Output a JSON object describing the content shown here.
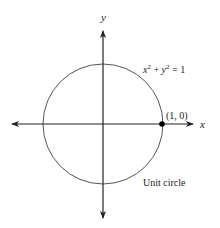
{
  "diagram": {
    "title": "Unit circle",
    "equation": {
      "x": "x",
      "exp1": "2",
      "plus": " + ",
      "y": "y",
      "exp2": "2",
      "eq": " = 1"
    },
    "axes": {
      "x_label": "x",
      "y_label": "y"
    },
    "point": {
      "label": "(1, 0)"
    },
    "caption": "Unit circle",
    "colors": {
      "stroke": "#222222",
      "circle": "#555555",
      "point": "#000000"
    }
  }
}
